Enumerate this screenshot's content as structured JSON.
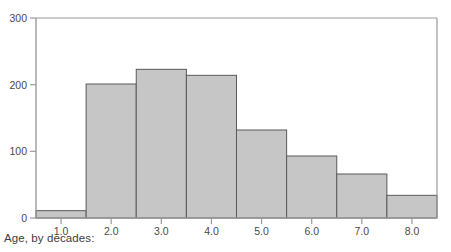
{
  "chart_data": {
    "type": "bar",
    "title": "",
    "subtitle": "",
    "xlabel": "Age, by decades:",
    "ylabel": "",
    "categories": [
      "1.0",
      "2.0",
      "3.0",
      "4.0",
      "5.0",
      "6.0",
      "7.0",
      "8.0"
    ],
    "values": [
      11,
      201,
      223,
      214,
      132,
      93,
      66,
      34
    ],
    "series": [
      {
        "name": "Count",
        "values": [
          11,
          201,
          223,
          214,
          132,
          93,
          66,
          34
        ]
      }
    ],
    "xlim": [
      0.5,
      8.5
    ],
    "ylim": [
      0,
      300
    ],
    "yticks": [
      0,
      100,
      200,
      300
    ],
    "ytick_labels": [
      "0",
      "100",
      "200",
      "300"
    ],
    "xticks": [
      1.0,
      2.0,
      3.0,
      4.0,
      5.0,
      6.0,
      7.0,
      8.0
    ],
    "xtick_labels": [
      "1.0",
      "2.0",
      "3.0",
      "4.0",
      "5.0",
      "6.0",
      "7.0",
      "8.0"
    ],
    "grid": false,
    "legend": false,
    "legend_position": "none",
    "bar_fill_color": "#c6c6c6",
    "bar_edge_color": "#595959",
    "axis_color": "#8c8c8c",
    "text_color": "#4a4a4a",
    "background_color": "#ffffff",
    "bar_width": 1.0,
    "annotations": []
  },
  "caption": {
    "text": "Age, by decades:"
  }
}
